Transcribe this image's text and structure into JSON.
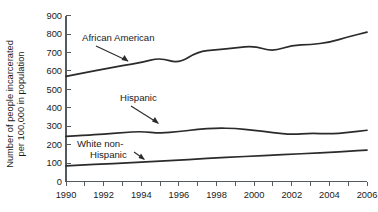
{
  "chart_data": {
    "type": "line",
    "title": "",
    "xlabel": "",
    "ylabel": "Number of people incarcerated per 100,000 in population",
    "xlim": [
      1990,
      2006
    ],
    "ylim": [
      0,
      900
    ],
    "grid": false,
    "legend_position": "inline-annotations",
    "x": [
      1990,
      1991,
      1992,
      1993,
      1994,
      1995,
      1996,
      1997,
      1998,
      1999,
      2000,
      2001,
      2002,
      2003,
      2004,
      2005,
      2006
    ],
    "x_tick_labels": [
      "1990",
      "1992",
      "1994",
      "1996",
      "1998",
      "2000",
      "2002",
      "2004",
      "2006"
    ],
    "y_tick_labels": [
      "0",
      "100",
      "200",
      "300",
      "400",
      "500",
      "600",
      "700",
      "800",
      "900"
    ],
    "y_ticks": [
      0,
      100,
      200,
      300,
      400,
      500,
      600,
      700,
      800,
      900
    ],
    "series": [
      {
        "name": "African American",
        "values": [
          570,
          590,
          610,
          628,
          645,
          672,
          640,
          705,
          715,
          725,
          735,
          705,
          740,
          742,
          755,
          785,
          810
        ]
      },
      {
        "name": "Hispanic",
        "values": [
          245,
          250,
          258,
          265,
          272,
          262,
          270,
          283,
          290,
          288,
          278,
          265,
          255,
          262,
          258,
          265,
          278
        ]
      },
      {
        "name": "White non-Hispanic",
        "values": [
          85,
          90,
          95,
          100,
          105,
          110,
          116,
          122,
          128,
          133,
          138,
          143,
          148,
          153,
          158,
          164,
          170
        ]
      }
    ],
    "annotations": [
      {
        "label": "African American",
        "label_line_1": "African American",
        "label_line_2": ""
      },
      {
        "label": "Hispanic",
        "label_line_1": "Hispanic",
        "label_line_2": ""
      },
      {
        "label": "White non-Hispanic",
        "label_line_1": "White non-",
        "label_line_2": "Hispanic"
      }
    ],
    "colors": {
      "line": "#2b2b2b",
      "axis": "#555a5e",
      "text": "#1a1a1a",
      "background": "#ffffff"
    }
  }
}
